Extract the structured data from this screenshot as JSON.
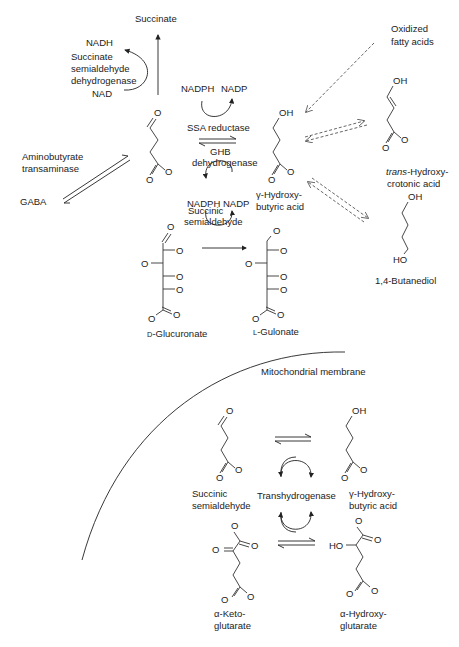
{
  "diagram": {
    "top": {
      "succinate": "Succinate",
      "nadh": "NADH",
      "ssadh_line1": "Succinate",
      "ssadh_line2": "semialdehyde",
      "ssadh_line3": "dehydrogenase",
      "nad": "NAD",
      "nadph_1": "NADPH",
      "nadp_1": "NADP",
      "ssa_reductase": "SSA reductase",
      "ghb_dh_line1": "GHB",
      "ghb_dh_line2": "dehydrogenase",
      "nadph_2": "NADPH",
      "nadp_2": "NADP",
      "aminobutyrate_line1": "Aminobutyrate",
      "aminobutyrate_line2": "transaminase",
      "gaba": "GABA",
      "ssa_line1": "Succinic",
      "ssa_line2": "semialdehyde",
      "ghb_line1": "γ-Hydroxy-",
      "ghb_line2": "butyric acid",
      "oxidized_line1": "Oxidized",
      "oxidized_line2": "fatty acids",
      "thca_italic": "trans",
      "thca_rest": "-Hydroxy-",
      "thca_line2": "crotonic acid",
      "butanediol": "1,4-Butanediol",
      "glucuronate": "D-Glucuronate",
      "gulonate": "L-Gulonate"
    },
    "mito": {
      "membrane": "Mitochondrial membrane",
      "ssa_line1": "Succinic",
      "ssa_line2": "semialdehyde",
      "transhydrogenase": "Transhydrogenase",
      "ghb_line1": "γ-Hydroxy-",
      "ghb_line2": "butyric acid",
      "akg_line1": "α-Keto-",
      "akg_line2": "glutarate",
      "ahg_line1": "α-Hydroxy-",
      "ahg_line2": "glutarate"
    },
    "atoms": {
      "O": "O",
      "OH": "OH",
      "HO": "HO"
    }
  }
}
